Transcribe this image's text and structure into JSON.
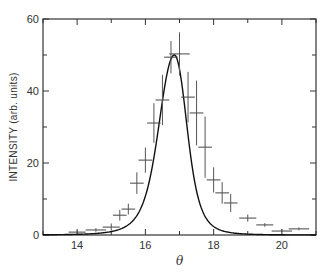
{
  "chart_data": {
    "type": "scatter",
    "title": "",
    "xlabel": "θ",
    "ylabel": "INTENSITY (arb. units)",
    "xlim": [
      13,
      21
    ],
    "ylim": [
      0,
      60
    ],
    "xticks": [
      14,
      16,
      18,
      20
    ],
    "yticks": [
      0,
      20,
      40,
      60
    ],
    "x_minor_step": 1,
    "y_minor_step": 10,
    "grid": false,
    "legend": null,
    "series": [
      {
        "name": "measured",
        "kind": "points_with_error_bars",
        "x": [
          14.0,
          14.55,
          15.0,
          15.25,
          15.5,
          15.75,
          16.0,
          16.25,
          16.5,
          16.75,
          17.0,
          17.25,
          17.5,
          17.75,
          18.0,
          18.25,
          18.5,
          19.0,
          19.5,
          20.0,
          20.5
        ],
        "y": [
          0.8,
          1.4,
          2.2,
          5.5,
          7.2,
          14.4,
          20.8,
          31.1,
          37.5,
          49.4,
          50.3,
          38.3,
          33.9,
          24.4,
          15.3,
          11.7,
          8.9,
          4.7,
          2.8,
          1.1,
          1.7
        ],
        "yerr": [
          0.5,
          0.5,
          1.0,
          1.5,
          1.5,
          3.0,
          3.5,
          5.5,
          7.0,
          4.5,
          6.0,
          7.0,
          9.0,
          8.5,
          3.5,
          3.0,
          2.5,
          1.0,
          0.5,
          0.4,
          0.4
        ],
        "xerr": [
          0.25,
          0.3,
          0.25,
          0.2,
          0.2,
          0.2,
          0.2,
          0.2,
          0.2,
          0.2,
          0.3,
          0.2,
          0.2,
          0.2,
          0.2,
          0.2,
          0.2,
          0.25,
          0.25,
          0.3,
          0.3
        ]
      },
      {
        "name": "fit",
        "kind": "line",
        "peak_x": 16.85,
        "peak_y": 50,
        "note": "asymmetric peak fit curve"
      }
    ]
  }
}
